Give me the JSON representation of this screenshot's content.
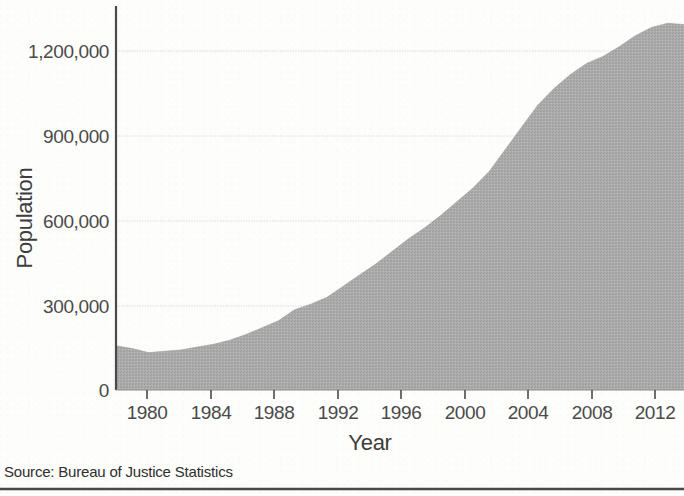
{
  "figure": {
    "background_color": "#fdfdfc",
    "source_note": "Source: Bureau of Justice Statistics",
    "clipped_title": "",
    "rule_color": "#4a4a4a"
  },
  "chart_data": {
    "type": "area",
    "title": "",
    "xlabel": "Year",
    "ylabel": "Population",
    "xlim": [
      1978,
      2013
    ],
    "ylim": [
      0,
      1380000
    ],
    "grid": true,
    "grid_axis": "y",
    "legend": "none",
    "series_color": "#a9a9a9",
    "axis_color": "#4a4a4a",
    "gridline_color": "#d8d8d6",
    "ytick_labels": [
      "1,200,000",
      "900,000",
      "600,000",
      "300,000",
      "0"
    ],
    "ytick_values": [
      1200000,
      900000,
      600000,
      300000,
      0
    ],
    "xtick_labels": [
      "1980",
      "1984",
      "1988",
      "1992",
      "1996",
      "2000",
      "2004",
      "2008",
      "2012"
    ],
    "xtick_values": [
      1980,
      1984,
      1988,
      1992,
      1996,
      2000,
      2004,
      2008,
      2012
    ],
    "x": [
      1978,
      1979,
      1980,
      1981,
      1982,
      1983,
      1984,
      1985,
      1986,
      1987,
      1988,
      1989,
      1990,
      1991,
      1992,
      1993,
      1994,
      1995,
      1996,
      1997,
      1998,
      1999,
      2000,
      2001,
      2002,
      2003,
      2004,
      2005,
      2006,
      2007,
      2008,
      2009,
      2010,
      2011,
      2012,
      2013
    ],
    "values": [
      160000,
      150000,
      135000,
      140000,
      145000,
      155000,
      165000,
      180000,
      200000,
      225000,
      250000,
      290000,
      310000,
      335000,
      375000,
      415000,
      455000,
      500000,
      545000,
      585000,
      630000,
      680000,
      730000,
      790000,
      870000,
      950000,
      1030000,
      1090000,
      1140000,
      1180000,
      1205000,
      1240000,
      1280000,
      1310000,
      1325000,
      1320000
    ],
    "series": [
      {
        "name": "Population",
        "values": [
          160000,
          150000,
          135000,
          140000,
          145000,
          155000,
          165000,
          180000,
          200000,
          225000,
          250000,
          290000,
          310000,
          335000,
          375000,
          415000,
          455000,
          500000,
          545000,
          585000,
          630000,
          680000,
          730000,
          790000,
          870000,
          950000,
          1030000,
          1090000,
          1140000,
          1180000,
          1205000,
          1240000,
          1280000,
          1310000,
          1325000,
          1320000
        ]
      }
    ]
  }
}
